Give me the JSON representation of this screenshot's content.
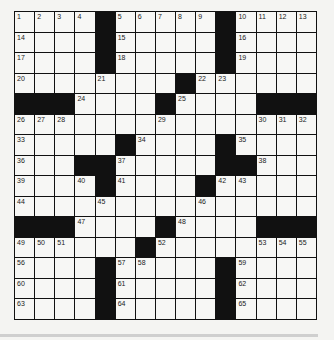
{
  "puzzle": {
    "rows": 15,
    "cols": 15,
    "layout": [
      "....#.....#....",
      "....#.....#....",
      "....#.....#....",
      "........#......",
      "###....#....###",
      "...............",
      ".....#....#....",
      "...##.....##...",
      "....#....#.....",
      "...............",
      "###....#....###",
      "......#........",
      "....#.....#....",
      "....#.....#....",
      "....#.....#...."
    ],
    "numbers": {
      "0,0": "1",
      "0,1": "2",
      "0,2": "3",
      "0,3": "4",
      "0,5": "5",
      "0,6": "6",
      "0,7": "7",
      "0,8": "8",
      "0,9": "9",
      "0,11": "10",
      "0,12": "11",
      "0,13": "12",
      "0,14": "13",
      "1,0": "14",
      "1,5": "15",
      "1,11": "16",
      "2,0": "17",
      "2,5": "18",
      "2,11": "19",
      "3,0": "20",
      "3,4": "21",
      "3,9": "22",
      "3,10": "23",
      "4,3": "24",
      "4,8": "25",
      "5,0": "26",
      "5,1": "27",
      "5,2": "28",
      "5,7": "29",
      "5,12": "30",
      "5,13": "31",
      "5,14": "32",
      "6,0": "33",
      "6,6": "34",
      "6,11": "35",
      "7,0": "36",
      "7,5": "37",
      "7,12": "38",
      "8,0": "39",
      "8,3": "40",
      "8,5": "41",
      "8,10": "42",
      "8,11": "43",
      "9,0": "44",
      "9,4": "45",
      "9,9": "46",
      "10,3": "47",
      "10,8": "48",
      "11,0": "49",
      "11,1": "50",
      "11,2": "51",
      "11,7": "52",
      "11,12": "53",
      "11,13": "54",
      "11,14": "55",
      "12,0": "56",
      "12,5": "57",
      "12,6": "58",
      "12,11": "59",
      "13,0": "60",
      "13,5": "61",
      "13,11": "62",
      "14,0": "63",
      "14,5": "64",
      "14,11": "65"
    }
  }
}
